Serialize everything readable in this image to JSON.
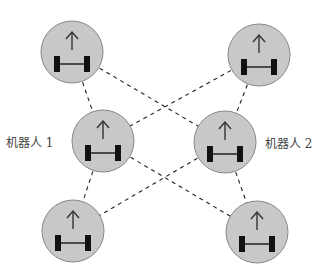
{
  "diagram": {
    "colors": {
      "robot_fill": "#c8c8c8",
      "robot_stroke": "#888888",
      "wheel": "#111111",
      "axle": "#222222",
      "arrow": "#333333",
      "link": "#222222"
    },
    "robots": [
      {
        "id": "tl",
        "cx": 72,
        "cy": 52
      },
      {
        "id": "tr",
        "cx": 259,
        "cy": 55
      },
      {
        "id": "ml",
        "cx": 103,
        "cy": 141
      },
      {
        "id": "mr",
        "cx": 225,
        "cy": 142
      },
      {
        "id": "bl",
        "cx": 73,
        "cy": 231
      },
      {
        "id": "br",
        "cx": 257,
        "cy": 232
      }
    ],
    "links": [
      [
        "tl",
        "ml"
      ],
      [
        "tl",
        "mr"
      ],
      [
        "tr",
        "mr"
      ],
      [
        "tr",
        "ml"
      ],
      [
        "ml",
        "bl"
      ],
      [
        "ml",
        "br"
      ],
      [
        "mr",
        "br"
      ],
      [
        "mr",
        "bl"
      ]
    ],
    "labels": {
      "robot1": "机器人 1",
      "robot2": "机器人 2"
    }
  }
}
